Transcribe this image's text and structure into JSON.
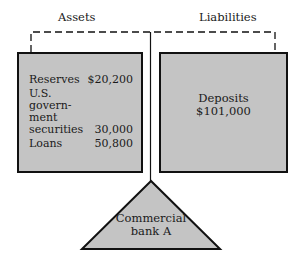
{
  "header": {
    "assets_label": "Assets",
    "liabilities_label": "Liabilities"
  },
  "assets": {
    "rows": [
      {
        "label": "Reserves",
        "value": "$20,200"
      },
      {
        "label_lines": [
          "U.S.",
          "govern-",
          "ment",
          "securities"
        ],
        "value": "30,000"
      },
      {
        "label": "Loans",
        "value": "50,800"
      }
    ],
    "reserves_label": "Reserves",
    "reserves_value": "$20,200",
    "securities_line1": "U.S.",
    "securities_line2": "govern-",
    "securities_line3": "ment",
    "securities_line4": "securities",
    "securities_value": "30,000",
    "loans_label": "Loans",
    "loans_value": "50,800"
  },
  "liabilities": {
    "deposits_label": "Deposits",
    "deposits_value": "$101,000"
  },
  "fulcrum": {
    "line1": "Commercial",
    "line2": "bank A"
  },
  "colors": {
    "box_fill": "#c4c4c4",
    "outline": "#111111",
    "background": "#ffffff"
  }
}
